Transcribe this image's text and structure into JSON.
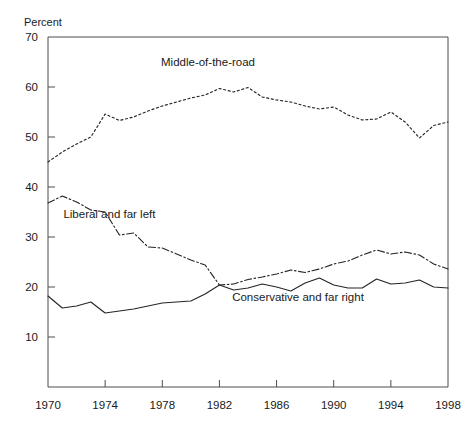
{
  "chart_data": {
    "type": "line",
    "title": "",
    "xlabel": "",
    "ylabel": "Percent",
    "ylim": [
      0,
      70
    ],
    "xlim": [
      1970,
      1998
    ],
    "yticks": [
      70,
      60,
      50,
      40,
      30,
      20,
      10
    ],
    "ytick_labels": [
      "70",
      "60",
      "50",
      "40",
      "30",
      "20",
      "10"
    ],
    "xticks": [
      1970,
      1974,
      1978,
      1982,
      1986,
      1990,
      1994,
      1998
    ],
    "xtick_labels": [
      "1970",
      "1974",
      "1978",
      "1982",
      "1986",
      "1990",
      "1994",
      "1998"
    ],
    "grid": false,
    "legend_position": "inline-annotations",
    "x": [
      1970,
      1971,
      1972,
      1973,
      1974,
      1975,
      1976,
      1977,
      1978,
      1979,
      1980,
      1981,
      1982,
      1983,
      1984,
      1985,
      1986,
      1987,
      1988,
      1989,
      1990,
      1991,
      1992,
      1993,
      1994,
      1995,
      1996,
      1997,
      1998
    ],
    "series": [
      {
        "name": "Middle-of-the-road",
        "style": "dotted",
        "color": "#262626",
        "label_x": 1981.2,
        "label_y": 64.2,
        "values": [
          45.0,
          47.0,
          48.6,
          50.0,
          54.6,
          53.3,
          54.0,
          55.2,
          56.2,
          57.0,
          57.8,
          58.4,
          59.7,
          59.0,
          59.9,
          58.0,
          57.4,
          57.0,
          56.2,
          55.6,
          56.0,
          54.4,
          53.4,
          53.6,
          55.0,
          53.0,
          49.8,
          52.3,
          53.0
        ]
      },
      {
        "name": "Liberal and far left",
        "style": "dash-dot",
        "color": "#262626",
        "label_x": 1974.3,
        "label_y": 33.8,
        "values": [
          36.8,
          38.2,
          37.0,
          35.4,
          35.0,
          30.4,
          30.8,
          28.0,
          27.8,
          26.6,
          25.4,
          24.4,
          20.4,
          20.6,
          21.5,
          22.0,
          22.6,
          23.4,
          22.9,
          23.6,
          24.6,
          25.2,
          26.4,
          27.4,
          26.6,
          27.0,
          26.4,
          24.6,
          23.6
        ]
      },
      {
        "name": "Conservative and far right",
        "style": "solid",
        "color": "#262626",
        "label_x": 1987.5,
        "label_y": 17.2,
        "values": [
          18.2,
          15.8,
          16.2,
          17.0,
          14.8,
          15.2,
          15.6,
          16.2,
          16.8,
          17.0,
          17.2,
          18.6,
          20.4,
          19.4,
          19.8,
          20.6,
          20.0,
          19.2,
          20.8,
          21.8,
          20.4,
          19.8,
          19.8,
          21.6,
          20.6,
          20.8,
          21.4,
          20.0,
          19.8
        ]
      }
    ]
  }
}
